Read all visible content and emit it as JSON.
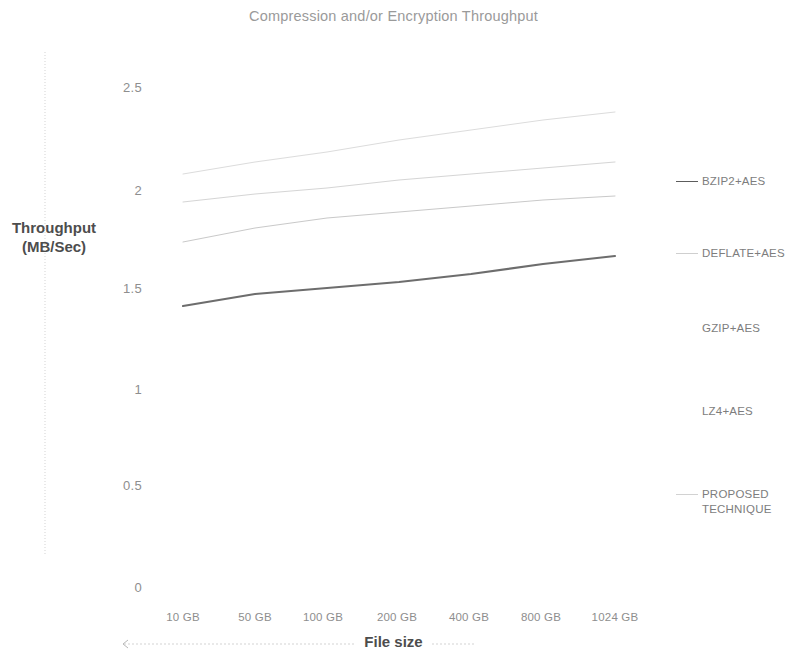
{
  "chart_data": {
    "type": "line",
    "title": "Compression and/or Encryption Throughput",
    "xlabel": "File size",
    "ylabel": "Throughput\n(MB/Sec)",
    "ylabel_line1": "Throughput",
    "ylabel_line2": "(MB/Sec)",
    "categories": [
      "10 GB",
      "50 GB",
      "100 GB",
      "200 GB",
      "400 GB",
      "800 GB",
      "1024 GB"
    ],
    "x": [
      "10 GB",
      "50 GB",
      "100 GB",
      "200 GB",
      "400 GB",
      "800 GB",
      "1024 GB"
    ],
    "yticks": [
      "0",
      "0.5",
      "1",
      "1.5",
      "2",
      "2.5"
    ],
    "ytick_values": [
      0,
      0.5,
      1,
      1.5,
      2,
      2.5
    ],
    "ylim": [
      0,
      2.5
    ],
    "grid": false,
    "legend_position": "right",
    "series": [
      {
        "name": "BZIP2+AES",
        "color": "#6d6d6d",
        "width": 2.1,
        "values": [
          1.41,
          1.47,
          1.5,
          1.53,
          1.57,
          1.62,
          1.66
        ]
      },
      {
        "name": "DEFLATE+AES",
        "color": "#c9c9c9",
        "width": 1.0,
        "values": [
          1.73,
          1.8,
          1.85,
          1.88,
          1.91,
          1.94,
          1.96
        ]
      },
      {
        "name": "GZIP+AES",
        "color": "#d5d5d5",
        "width": 1.0,
        "values": [
          1.93,
          1.97,
          2.0,
          2.04,
          2.07,
          2.1,
          2.13
        ]
      },
      {
        "name": "LZ4+AES",
        "color": "#dcdcdc",
        "width": 1.0,
        "values": [
          2.07,
          2.13,
          2.18,
          2.24,
          2.29,
          2.34,
          2.38
        ]
      },
      {
        "name": "PROPOSED TECHNIQUE",
        "color": "#d0d0d0",
        "width": 1.0,
        "values": [
          null,
          null,
          null,
          null,
          null,
          null,
          null
        ]
      }
    ]
  },
  "legend": {
    "items": [
      {
        "label": "BZIP2+AES",
        "swatch": "#5c5c5c",
        "top": 174
      },
      {
        "label": "DEFLATE+AES",
        "swatch": "#cfcfcf",
        "top": 246
      },
      {
        "label": "GZIP+AES",
        "swatch": "#ffffff",
        "top": 321
      },
      {
        "label": "LZ4+AES",
        "swatch": "#ffffff",
        "top": 404
      },
      {
        "label": "PROPOSED\nTECHNIQUE",
        "swatch": "#d2d2d2",
        "top": 487
      }
    ]
  },
  "axes": {
    "y_ticks": [
      {
        "label": "2.5",
        "top": 80,
        "left": 96
      },
      {
        "label": "2",
        "top": 183,
        "left": 96
      },
      {
        "label": "1.5",
        "top": 281,
        "left": 96
      },
      {
        "label": "1",
        "top": 382,
        "left": 96
      },
      {
        "label": "0.5",
        "top": 478,
        "left": 96
      },
      {
        "label": "0",
        "top": 580,
        "left": 96
      }
    ],
    "x_ticks": [
      {
        "label": "10 GB",
        "left": 146
      },
      {
        "label": "50 GB",
        "left": 218
      },
      {
        "label": "100 GB",
        "left": 286
      },
      {
        "label": "200 GB",
        "left": 360
      },
      {
        "label": "400 GB",
        "left": 432
      },
      {
        "label": "800 GB",
        "left": 504
      },
      {
        "label": "1024 GB",
        "left": 578
      }
    ]
  },
  "colors": {
    "title": "#9a9a9a",
    "axis_text": "#8e8e8e",
    "axis_title": "#4d4d4d",
    "background": "#ffffff",
    "rule": "#cfcfcf"
  }
}
